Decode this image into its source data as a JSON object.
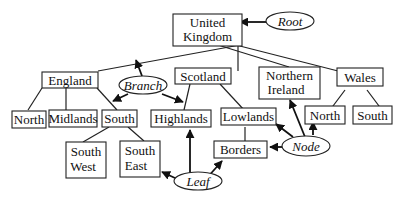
{
  "diagram": {
    "nodes": {
      "uk": [
        "United",
        "Kingdom"
      ],
      "england": "England",
      "scotland": "Scotland",
      "ni": [
        "Northern",
        "Ireland"
      ],
      "wales": "Wales",
      "e_north": "North",
      "midlands": "Midlands",
      "e_south": "South",
      "southwest": [
        "South",
        "West"
      ],
      "southeast": [
        "South",
        "East"
      ],
      "highlands": "Highlands",
      "lowlands": "Lowlands",
      "borders": "Borders",
      "w_north": "North",
      "w_south": "South"
    },
    "labels": {
      "root": "Root",
      "branch": "Branch",
      "leaf": "Leaf",
      "node": "Node"
    },
    "edges": [
      [
        "United Kingdom",
        "England"
      ],
      [
        "United Kingdom",
        "Scotland"
      ],
      [
        "United Kingdom",
        "Northern Ireland"
      ],
      [
        "United Kingdom",
        "Wales"
      ],
      [
        "England",
        "North"
      ],
      [
        "England",
        "Midlands"
      ],
      [
        "England",
        "South"
      ],
      [
        "South",
        "South West"
      ],
      [
        "South",
        "South East"
      ],
      [
        "Scotland",
        "Highlands"
      ],
      [
        "Scotland",
        "Lowlands"
      ],
      [
        "Lowlands",
        "Borders"
      ],
      [
        "Wales",
        "North"
      ],
      [
        "Wales",
        "South"
      ]
    ]
  }
}
